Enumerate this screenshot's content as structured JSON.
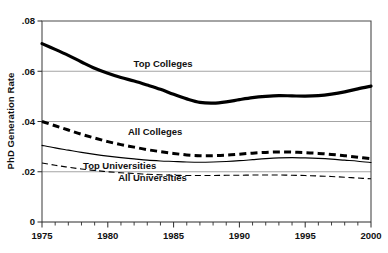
{
  "chart_data": {
    "type": "line",
    "title": "",
    "xlabel": "",
    "ylabel": "PhD Generation Rate",
    "xlim": [
      1975,
      2000
    ],
    "ylim": [
      0,
      0.08
    ],
    "grid": true,
    "legend_position": "inline-annotations",
    "xticks": [
      1975,
      1980,
      1985,
      1990,
      1995,
      2000
    ],
    "xtick_labels": [
      "1975",
      "1980",
      "1985",
      "1990",
      "1995",
      "2000"
    ],
    "xminor_tick_step": 1,
    "yticks": [
      0,
      0.02,
      0.04,
      0.06,
      0.08
    ],
    "ytick_labels": [
      "0",
      ".02",
      ".04",
      ".06",
      ".08"
    ],
    "x": [
      1975,
      1976,
      1977,
      1978,
      1979,
      1980,
      1981,
      1982,
      1983,
      1984,
      1985,
      1986,
      1987,
      1988,
      1989,
      1990,
      1991,
      1992,
      1993,
      1994,
      1995,
      1996,
      1997,
      1998,
      1999,
      2000
    ],
    "series": [
      {
        "name": "Top Colleges",
        "style": "thick-solid",
        "color": "#000000",
        "label_x": 1984.2,
        "label_y": 0.0615,
        "values": [
          0.071,
          0.0687,
          0.0663,
          0.0637,
          0.0612,
          0.0592,
          0.0575,
          0.0561,
          0.0545,
          0.0528,
          0.0508,
          0.049,
          0.0476,
          0.0473,
          0.0478,
          0.0487,
          0.0495,
          0.05,
          0.0503,
          0.0502,
          0.0501,
          0.0503,
          0.0509,
          0.0518,
          0.053,
          0.0541
        ]
      },
      {
        "name": "All Colleges",
        "style": "thick-dashed",
        "color": "#000000",
        "label_x": 1983.6,
        "label_y": 0.0345,
        "values": [
          0.04,
          0.0383,
          0.0366,
          0.0349,
          0.0334,
          0.032,
          0.0308,
          0.0298,
          0.0288,
          0.028,
          0.0273,
          0.0267,
          0.0264,
          0.0264,
          0.0266,
          0.027,
          0.0274,
          0.0277,
          0.0279,
          0.0278,
          0.0276,
          0.0273,
          0.0269,
          0.0264,
          0.0258,
          0.0252
        ]
      },
      {
        "name": "Top Universities",
        "style": "thin-solid",
        "color": "#000000",
        "label_x": 1980.9,
        "label_y": 0.0212,
        "values": [
          0.0305,
          0.0295,
          0.0286,
          0.0277,
          0.0269,
          0.0262,
          0.0256,
          0.0251,
          0.0246,
          0.0243,
          0.0241,
          0.0239,
          0.0238,
          0.0239,
          0.0241,
          0.0244,
          0.0248,
          0.0252,
          0.0255,
          0.0256,
          0.0255,
          0.0253,
          0.025,
          0.0246,
          0.0242,
          0.0237
        ]
      },
      {
        "name": "All Universities",
        "style": "thin-dashed",
        "color": "#000000",
        "label_x": 1983.4,
        "label_y": 0.0163,
        "values": [
          0.0235,
          0.0226,
          0.0218,
          0.0211,
          0.0205,
          0.02,
          0.0196,
          0.0193,
          0.019,
          0.0188,
          0.0186,
          0.0185,
          0.0185,
          0.0185,
          0.0186,
          0.0186,
          0.0187,
          0.0187,
          0.0187,
          0.0186,
          0.0185,
          0.0183,
          0.0181,
          0.0178,
          0.0175,
          0.0172
        ]
      }
    ]
  }
}
